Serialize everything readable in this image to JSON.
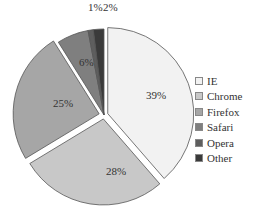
{
  "chart_data": {
    "type": "pie",
    "title": "",
    "categories": [
      "IE",
      "Chrome",
      "Firefox",
      "Safari",
      "Opera",
      "Other"
    ],
    "values": [
      39,
      28,
      25,
      6,
      1,
      2
    ],
    "labels": [
      "39%",
      "28%",
      "25%",
      "6%",
      "1%",
      "2%"
    ],
    "colors": [
      "#f2f2f2",
      "#c8c8c8",
      "#a6a6a6",
      "#7f7f7f",
      "#5e5e5e",
      "#3a3a3a"
    ],
    "exploded": [
      "IE",
      "Chrome",
      "Firefox"
    ],
    "start_angle": "12 o'clock, clockwise",
    "legend_position": "right"
  },
  "legend": {
    "items": [
      {
        "label": "IE",
        "color": "#f2f2f2"
      },
      {
        "label": "Chrome",
        "color": "#c8c8c8"
      },
      {
        "label": "Firefox",
        "color": "#a6a6a6"
      },
      {
        "label": "Safari",
        "color": "#7f7f7f"
      },
      {
        "label": "Opera",
        "color": "#5e5e5e"
      },
      {
        "label": "Other",
        "color": "#3a3a3a"
      }
    ]
  }
}
